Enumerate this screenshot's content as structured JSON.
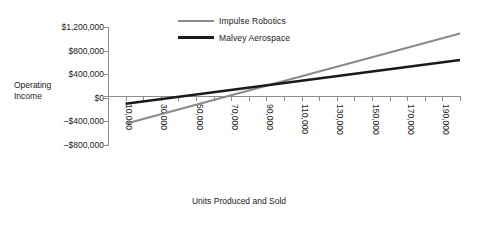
{
  "chart_data": {
    "type": "line",
    "title": "",
    "xlabel": "Units Produced and Sold",
    "ylabel": "Operating Income",
    "xlim": [
      0,
      200000
    ],
    "ylim": [
      -800000,
      1200000
    ],
    "grid": false,
    "legend_position": "top-center",
    "x_tick_labels": [
      "10,000",
      "30,000",
      "50,000",
      "70,000",
      "90,000",
      "110,000",
      "130,000",
      "150,000",
      "170,000",
      "190,000"
    ],
    "x_tick_values": [
      10000,
      30000,
      50000,
      70000,
      90000,
      110000,
      130000,
      150000,
      170000,
      190000
    ],
    "x_minor_tick_values": [
      0,
      10000,
      20000,
      30000,
      40000,
      50000,
      60000,
      70000,
      80000,
      90000,
      100000,
      110000,
      120000,
      130000,
      140000,
      150000,
      160000,
      170000,
      180000,
      190000,
      200000
    ],
    "y_tick_labels": [
      "$1,200,000",
      "$800,000",
      "$400,000",
      "$0",
      "–$400,000",
      "–$800,000"
    ],
    "y_tick_values": [
      1200000,
      800000,
      400000,
      0,
      -400000,
      -800000
    ],
    "x": [
      10000,
      200000
    ],
    "series": [
      {
        "name": "Impulse Robotics",
        "color": "#8a8a8a",
        "width": 2,
        "values": [
          -440000,
          1090000
        ]
      },
      {
        "name": "Malvey Aerospace",
        "color": "#1a1a1a",
        "width": 2.6,
        "values": [
          -100000,
          640000
        ]
      }
    ]
  },
  "legend": {
    "items": [
      {
        "label": "Impulse Robotics"
      },
      {
        "label": "Malvey Aerospace"
      }
    ]
  },
  "axis_titles": {
    "y_line1": "Operating",
    "y_line2": "Income",
    "x": "Units Produced and Sold"
  }
}
